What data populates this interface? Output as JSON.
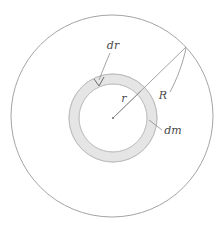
{
  "figure": {
    "type": "physics-diagram",
    "background_color": "#ffffff",
    "stroke_color": "#8c8c8c",
    "label_color": "#4a4a4a",
    "ring_fill_color": "#e3e3e3",
    "outer_circle": {
      "name": "disk-outline",
      "center_x": 112,
      "center_y": 116,
      "radius": 101
    },
    "annulus": {
      "name": "ring-element",
      "center_x": 113,
      "center_y": 118,
      "outer_radius": 44,
      "inner_radius": 34
    },
    "center_point": {
      "name": "center-dot",
      "x": 113,
      "y": 118
    },
    "radius_line_R": {
      "name": "radius-R-line",
      "x1": 113,
      "y1": 118,
      "x2": 186,
      "y2": 47
    },
    "radius_line_r": {
      "name": "radius-r-line",
      "x1": 113,
      "y1": 118,
      "x2": 141,
      "y2": 91
    },
    "labels": [
      {
        "id": "dr",
        "text": "dr",
        "x": 113,
        "y": 46,
        "anchor": "middle"
      },
      {
        "id": "r",
        "text": "r",
        "x": 124,
        "y": 99,
        "anchor": "middle"
      },
      {
        "id": "R",
        "text": "R",
        "x": 163,
        "y": 96,
        "anchor": "middle"
      },
      {
        "id": "dm",
        "text": "dm",
        "x": 173,
        "y": 131,
        "anchor": "middle"
      }
    ],
    "leaders": [
      {
        "id": "dr-leader",
        "path": "M 110 53 C 106 62, 103 70, 99 80"
      },
      {
        "id": "dr-arrow-left",
        "path": "M 94 80 L 99 86"
      },
      {
        "id": "dr-arrow-right",
        "path": "M 99 86 L 104 78"
      },
      {
        "id": "R-leader",
        "path": "M 186 48 C 182 62, 176 78, 170 92"
      },
      {
        "id": "dm-leader",
        "path": "M 150 121 L 162 130"
      }
    ]
  }
}
